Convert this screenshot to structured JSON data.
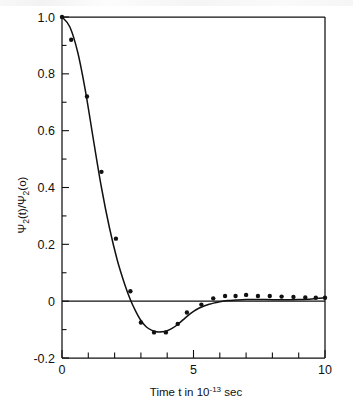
{
  "figure": {
    "background_color": "#ffffff",
    "ink_color": "#111111"
  },
  "chart_data": {
    "type": "line",
    "title": "",
    "subtitle": "",
    "xlabel": "Time t in 10⁻¹³ sec",
    "ylabel": "Ψ₂(t)/Ψ₂(o)",
    "ylabel_parts": {
      "psi_symbol": "Ψ",
      "subscript": "2",
      "numerator_arg": "(t)",
      "divider": "/",
      "denominator_arg": "(o)"
    },
    "xlabel_parts": {
      "prefix": "Time t in 10",
      "exponent": "-13",
      "suffix": "sec"
    },
    "xlim": [
      0,
      10
    ],
    "ylim": [
      -0.2,
      1.0
    ],
    "x_major_ticks": [
      0,
      5,
      10
    ],
    "x_major_tick_labels": [
      "0",
      "5",
      "10"
    ],
    "x_minor_tick_step": 1,
    "y_major_ticks": [
      -0.2,
      0,
      0.2,
      0.4,
      0.6,
      0.8,
      1.0
    ],
    "y_major_tick_labels": [
      "-0.2",
      "0",
      "0.2",
      "0.4",
      "0.6",
      "0.8",
      "1.0"
    ],
    "y_minor_tick_step": 0.1,
    "grid": false,
    "legend": null,
    "zero_reference_line": true,
    "series": [
      {
        "name": "data-points",
        "marker": "filled-circle",
        "marker_size_px": 4.4,
        "x": [
          0.0,
          0.35,
          0.95,
          1.5,
          2.05,
          2.6,
          3.0,
          3.5,
          3.95,
          4.4,
          4.75,
          5.3,
          5.75,
          6.2,
          6.6,
          7.0,
          7.45,
          7.9,
          8.35,
          8.8,
          9.25,
          9.65,
          10.0
        ],
        "y": [
          1.0,
          0.92,
          0.72,
          0.455,
          0.22,
          0.035,
          -0.075,
          -0.11,
          -0.11,
          -0.08,
          -0.04,
          -0.012,
          0.01,
          0.018,
          0.018,
          0.022,
          0.018,
          0.018,
          0.016,
          0.015,
          0.013,
          0.012,
          0.012
        ]
      },
      {
        "name": "fitted-curve",
        "marker": "none",
        "x": [
          0.0,
          0.3,
          0.6,
          0.9,
          1.2,
          1.5,
          1.8,
          2.1,
          2.4,
          2.6,
          2.8,
          3.0,
          3.2,
          3.4,
          3.6,
          3.8,
          4.0,
          4.2,
          4.4,
          4.6,
          4.8,
          5.0,
          5.2,
          5.4,
          5.6,
          5.8,
          6.0,
          6.3,
          6.6,
          7.0,
          7.5,
          8.0,
          8.5,
          9.0,
          9.5,
          10.0
        ],
        "y": [
          1.0,
          0.965,
          0.875,
          0.735,
          0.565,
          0.4,
          0.26,
          0.145,
          0.055,
          0.005,
          -0.035,
          -0.068,
          -0.09,
          -0.102,
          -0.108,
          -0.108,
          -0.104,
          -0.095,
          -0.082,
          -0.066,
          -0.05,
          -0.036,
          -0.025,
          -0.017,
          -0.011,
          -0.006,
          -0.002,
          0.002,
          0.004,
          0.006,
          0.006,
          0.005,
          0.005,
          0.006,
          0.008,
          0.012
        ]
      }
    ]
  }
}
